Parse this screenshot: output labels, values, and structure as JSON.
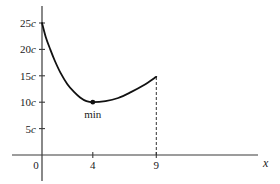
{
  "chart_data": {
    "type": "line",
    "title": "",
    "xlabel": "x",
    "ylabel": "",
    "xlim": [
      0,
      9
    ],
    "ylim": [
      0,
      25
    ],
    "grid": false,
    "legend": null,
    "x_ticks": [
      {
        "value": 0,
        "label": "0"
      },
      {
        "value": 4,
        "label": "4"
      },
      {
        "value": 9,
        "label": "9"
      }
    ],
    "y_ticks": [
      {
        "value": 5,
        "label": "5",
        "unit": "c"
      },
      {
        "value": 10,
        "label": "10",
        "unit": "c"
      },
      {
        "value": 15,
        "label": "15",
        "unit": "c"
      },
      {
        "value": 20,
        "label": "20",
        "unit": "c"
      },
      {
        "value": 25,
        "label": "25",
        "unit": "c"
      }
    ],
    "series": [
      {
        "name": "cost",
        "x": [
          0,
          0.3,
          0.65,
          1,
          1.45,
          2,
          2.5,
          3,
          3.5,
          4,
          5,
          6,
          7,
          8,
          9
        ],
        "y": [
          25,
          22.3,
          20,
          17.9,
          15.6,
          13.4,
          12.0,
          10.9,
          10.2,
          10,
          10.2,
          10.8,
          11.9,
          13.2,
          14.8
        ]
      }
    ],
    "annotations": [
      {
        "type": "point",
        "x": 4,
        "y": 10,
        "label": "min"
      },
      {
        "type": "dashed-vline",
        "x": 9,
        "from_y": 0,
        "to_y": 14.8
      }
    ],
    "colors": {
      "line": "#111111",
      "axis": "#333333",
      "background": "#ffffff"
    }
  }
}
